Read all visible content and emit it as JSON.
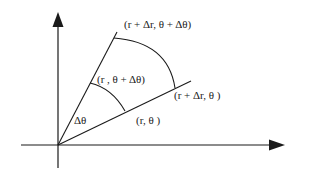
{
  "diagram": {
    "labels": {
      "outer_upper": "(r + Δr, θ + Δθ)",
      "inner_upper": "(r , θ + Δθ)",
      "outer_lower": "(r + Δr, θ )",
      "inner_lower": "(r, θ )",
      "angle": "Δθ"
    },
    "axes": {
      "x_axis": "horizontal-axis",
      "y_axis": "vertical-axis"
    },
    "colors": {
      "stroke": "#1a1a1a",
      "background": "#ffffff"
    }
  }
}
